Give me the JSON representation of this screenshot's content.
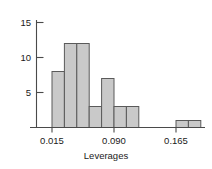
{
  "chart_data": {
    "type": "bar",
    "title": "",
    "subtitle": "",
    "xlabel": "Leverages",
    "ylabel": "",
    "grid": false,
    "legend": false,
    "legend_position": "none",
    "bin_width": 0.015,
    "bin_edges": [
      0.015,
      0.03,
      0.045,
      0.06,
      0.075,
      0.09,
      0.105,
      0.12,
      0.135,
      0.15,
      0.165,
      0.18,
      0.195
    ],
    "categories": [
      "0.015-0.030",
      "0.030-0.045",
      "0.045-0.060",
      "0.060-0.075",
      "0.075-0.090",
      "0.090-0.105",
      "0.105-0.120",
      "0.120-0.135",
      "0.135-0.150",
      "0.150-0.165",
      "0.165-0.180",
      "0.180-0.195"
    ],
    "values": [
      8,
      12,
      12,
      3,
      7,
      3,
      3,
      0,
      0,
      0,
      1,
      1
    ],
    "bars": [
      {
        "x0": 0.015,
        "x1": 0.03,
        "height": 8
      },
      {
        "x0": 0.03,
        "x1": 0.045,
        "height": 12
      },
      {
        "x0": 0.045,
        "x1": 0.06,
        "height": 12
      },
      {
        "x0": 0.06,
        "x1": 0.075,
        "height": 3
      },
      {
        "x0": 0.075,
        "x1": 0.09,
        "height": 7
      },
      {
        "x0": 0.09,
        "x1": 0.105,
        "height": 3
      },
      {
        "x0": 0.105,
        "x1": 0.12,
        "height": 3
      },
      {
        "x0": 0.165,
        "x1": 0.18,
        "height": 1
      },
      {
        "x0": 0.18,
        "x1": 0.195,
        "height": 1
      }
    ],
    "xlim": [
      0.0,
      0.21
    ],
    "ylim": [
      0,
      16
    ],
    "xticks": [
      0.015,
      0.09,
      0.165
    ],
    "xtick_labels": [
      "0.015",
      "0.090",
      "0.165"
    ],
    "yticks": [
      5,
      10,
      15
    ],
    "ytick_labels": [
      "5",
      "10",
      "15"
    ],
    "colors": {
      "bar_fill": "#c9c9c9",
      "bar_stroke": "#5a5a5a",
      "axis": "#4a4a4a",
      "text": "#1a1a1a",
      "background": "#ffffff"
    }
  }
}
